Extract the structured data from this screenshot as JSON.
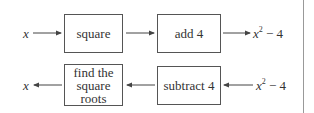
{
  "top_row": {
    "input": "x",
    "step1": "square",
    "step2": "add 4",
    "output_base": "x",
    "output_exp": "2",
    "output_rest": " − 4"
  },
  "bottom_row": {
    "input_base": "x",
    "input_exp": "2",
    "input_rest": " − 4",
    "step1": "subtract 4",
    "step2_line1": "find the",
    "step2_line2": "square",
    "step2_line3": "roots",
    "output": "x"
  }
}
